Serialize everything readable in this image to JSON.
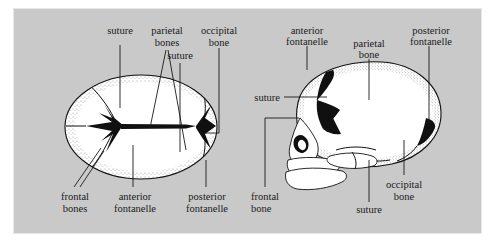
{
  "figure": {
    "background_color": "#c9c9c9",
    "panel_color": "#c9c9c9",
    "ink_color": "#111111",
    "bone_color": "#ffffff",
    "fontanelle_color": "#101010"
  },
  "left_view": {
    "name": "superior view of neonatal skull",
    "labels": {
      "suture_top": "suture",
      "parietal_bones_l1": "parietal",
      "parietal_bones_l2": "bones",
      "occipital_bone_l1": "occipital",
      "occipital_bone_l2": "bone",
      "suture_second": "suture",
      "frontal_bones_l1": "frontal",
      "frontal_bones_l2": "bones",
      "anterior_fontanelle_l1": "anterior",
      "anterior_fontanelle_l2": "fontanelle",
      "posterior_fontanelle_l1": "posterior",
      "posterior_fontanelle_l2": "fontanelle"
    }
  },
  "right_view": {
    "name": "lateral view of neonatal skull",
    "labels": {
      "anterior_fontanelle_l1": "anterior",
      "anterior_fontanelle_l2": "fontanelle",
      "parietal_bone_l1": "parietal",
      "parietal_bone_l2": "bone",
      "posterior_fontanelle_l1": "posterior",
      "posterior_fontanelle_l2": "fontanelle",
      "suture_left": "suture",
      "frontal_bone_l1": "frontal",
      "frontal_bone_l2": "bone",
      "occipital_bone_l1": "occipital",
      "occipital_bone_l2": "bone",
      "suture_bottom": "suture"
    }
  }
}
